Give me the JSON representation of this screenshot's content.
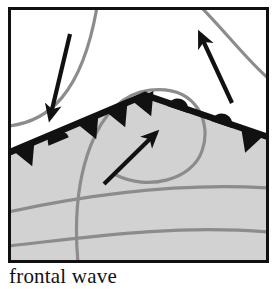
{
  "figure": {
    "caption": "frontal wave",
    "panel": {
      "border_color": "#101010",
      "background_color": "#ffffff",
      "border_width_px": 3,
      "x": 8,
      "y": 7,
      "width": 261,
      "height": 256
    },
    "colors": {
      "front_line": "#111111",
      "front_symbol": "#111111",
      "warm_sector_fill": "#d2d2d2",
      "isobar": "#8c8c8c",
      "arrow": "#111111",
      "caption_text": "#121212"
    },
    "legend_labels": {
      "cold_front_symbol": "triangle",
      "warm_front_symbol": "semicircle",
      "warm_sector": "shaded region",
      "isobars": "gray curved lines"
    },
    "front": {
      "type": "frontal wave",
      "apex": {
        "x": 145,
        "y": 95
      },
      "left_branch_end": {
        "x": 8,
        "y": 153
      },
      "right_branch_end": {
        "x": 268,
        "y": 137
      },
      "line_width_px": 6,
      "cold_front_triangles": [
        {
          "x": 22,
          "y": 147,
          "side": "below"
        },
        {
          "x": 85,
          "y": 125,
          "side": "below"
        },
        {
          "x": 115,
          "y": 112,
          "side": "below"
        },
        {
          "x": 140,
          "y": 100,
          "side": "below"
        },
        {
          "x": 253,
          "y": 131,
          "side": "below"
        }
      ],
      "warm_front_semicircles": [
        {
          "x": 58,
          "y": 140,
          "side": "above"
        },
        {
          "x": 178,
          "y": 105,
          "side": "above"
        },
        {
          "x": 222,
          "y": 117,
          "side": "above"
        }
      ]
    },
    "arrows": [
      {
        "name": "cold-air-arrow",
        "label": "cold air flow",
        "x1": 70,
        "y1": 35,
        "x2": 50,
        "y2": 122,
        "direction": "down-right"
      },
      {
        "name": "warm-air-arrow",
        "label": "warm air flow",
        "x1": 105,
        "y1": 183,
        "x2": 158,
        "y2": 132,
        "direction": "up-right"
      },
      {
        "name": "outflow-arrow",
        "label": "poleward outflow",
        "x1": 231,
        "y1": 101,
        "x2": 199,
        "y2": 32,
        "direction": "up-left"
      }
    ],
    "isobars": [
      {
        "name": "isobar-upper-left",
        "path": "M 8 126 C 48 122 82 94 97 7"
      },
      {
        "name": "isobar-low-center",
        "path": "M 78 263 C 72 172 96 96 150 90 C 196 86 210 124 202 150 C 194 178 150 190 118 176"
      },
      {
        "name": "isobar-upper-right",
        "path": "M 201 7 C 231 36 250 62 268 78"
      },
      {
        "name": "isobar-lower-1",
        "path": "M 8 212 C 80 196 170 182 268 188"
      },
      {
        "name": "isobar-lower-2",
        "path": "M 8 246 C 80 238 170 224 268 232"
      }
    ]
  }
}
